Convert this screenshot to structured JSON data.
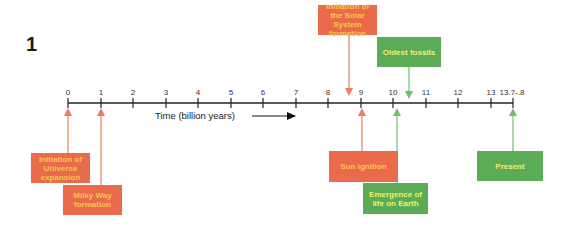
{
  "figure": {
    "number": "1",
    "axis_title": "Time (billion years)",
    "axis_arrow_icon": "right-arrow-icon"
  },
  "colors": {
    "red_box": "#ea6a4c",
    "red_text": "#f8c64c",
    "red_arrow": "#ee7c62",
    "green_box": "#5cab57",
    "green_text": "#eef26a",
    "green_arrow": "#6fbf68",
    "axis": "#222222"
  },
  "timeline": {
    "ticks": [
      {
        "label": "0",
        "value": 0
      },
      {
        "label": "1",
        "value": 1
      },
      {
        "label": "2",
        "value": 2
      },
      {
        "label": "3",
        "value": 3
      },
      {
        "label": "4",
        "value": 4
      },
      {
        "label": "5",
        "value": 5
      },
      {
        "label": "6",
        "value": 6
      },
      {
        "label": "7",
        "value": 7
      },
      {
        "label": "8",
        "value": 8
      },
      {
        "label": "9",
        "value": 9
      },
      {
        "label": "10",
        "value": 10
      },
      {
        "label": "11",
        "value": 11
      },
      {
        "label": "12",
        "value": 12
      },
      {
        "label": "13",
        "value": 13
      },
      {
        "label": "13.7-.8",
        "value": 13.75
      }
    ]
  },
  "events": [
    {
      "label": "Initiation of the Solar System formation",
      "lines": [
        "Initiation of the",
        "Solar System",
        "formation"
      ],
      "color": "red",
      "time": 8.6,
      "position": "above"
    },
    {
      "label": "Oldest fossils",
      "lines": [
        "Oldest",
        "fossils"
      ],
      "color": "green",
      "time": 10.5,
      "position": "above"
    },
    {
      "label": "Initiation of Universe expansion",
      "lines": [
        "Initiation of",
        "Universe",
        "expansion"
      ],
      "color": "red",
      "time": 0,
      "position": "below"
    },
    {
      "label": "Milky Way formation",
      "lines": [
        "Milky Way",
        "formation"
      ],
      "color": "red",
      "time": 1,
      "position": "below"
    },
    {
      "label": "Sun ignition",
      "lines": [
        "Sun ignition"
      ],
      "color": "red",
      "time": 9.1,
      "position": "below"
    },
    {
      "label": "Emergence of life on Earth",
      "lines": [
        "Emergence",
        "of life",
        "on Earth"
      ],
      "color": "green",
      "time": 10.2,
      "position": "below"
    },
    {
      "label": "Present",
      "lines": [
        "Present"
      ],
      "color": "green",
      "time": 13.75,
      "position": "below"
    }
  ]
}
